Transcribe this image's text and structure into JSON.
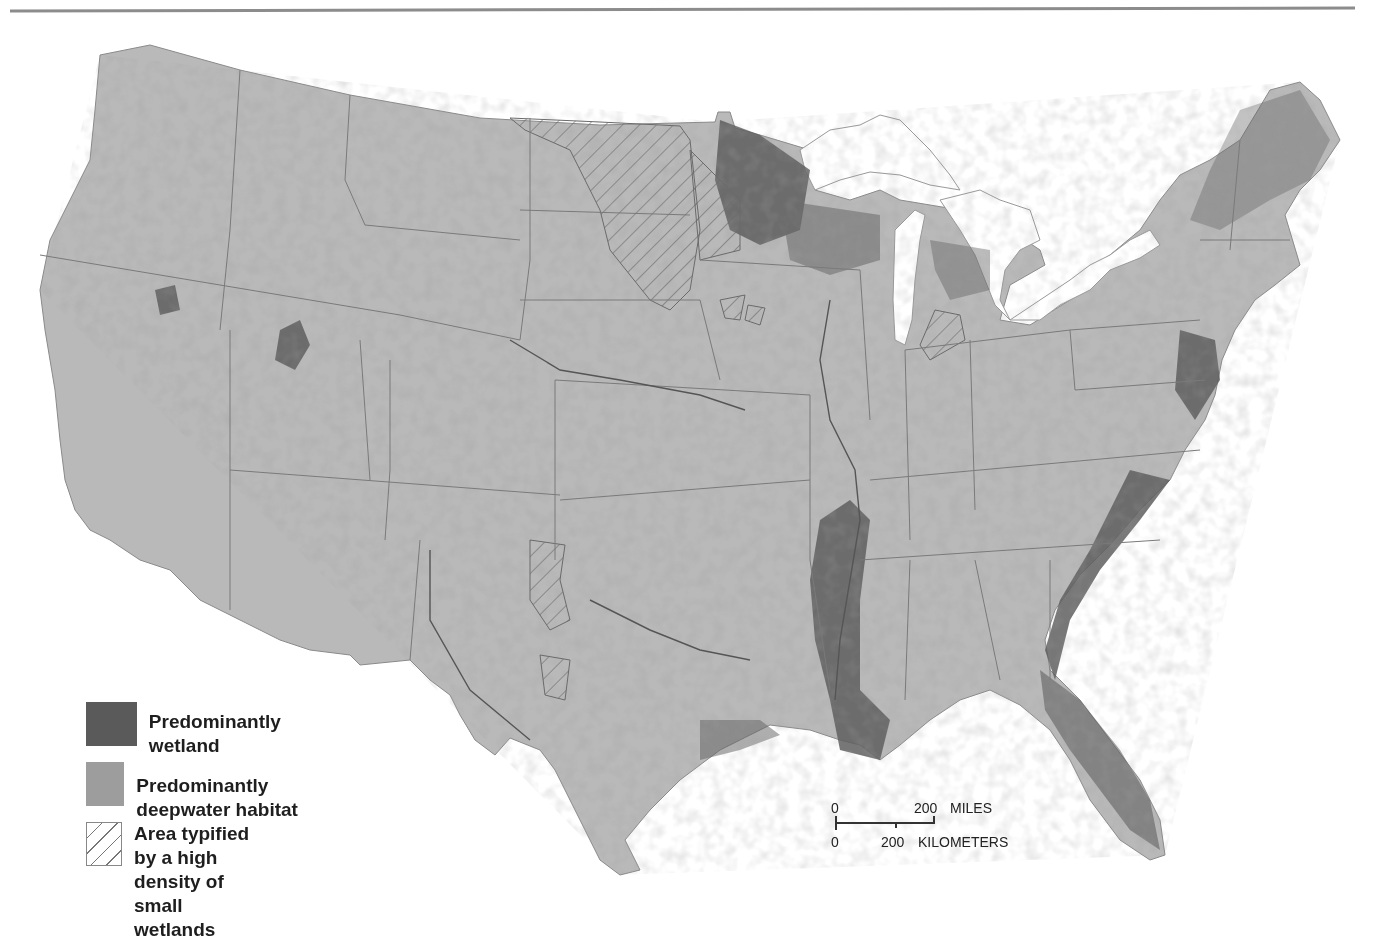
{
  "map": {
    "subject": "Wetlands and deepwater habitats of the conterminous United States",
    "colors": {
      "land": "#b9b9b9",
      "wetland": "#5a5a5a",
      "deepwater": "#9d9d9d",
      "border": "#6e6e6e",
      "water": "#ffffff"
    }
  },
  "legend": {
    "items": [
      {
        "swatch": "dark-fill",
        "label": "Predominantly wetland"
      },
      {
        "swatch": "medium-fill",
        "label": "Predominantly deepwater habitat"
      },
      {
        "swatch": "diagonal-hatch",
        "label_line1": "Area typified by a high",
        "label_line2": "density of small wetlands"
      }
    ]
  },
  "scale_bar": {
    "miles_zero": "0",
    "miles_value": "200",
    "miles_unit": "MILES",
    "km_zero": "0",
    "km_value": "200",
    "km_unit": "KILOMETERS"
  }
}
